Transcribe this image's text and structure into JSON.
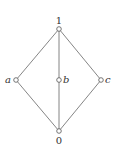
{
  "diagram": {
    "type": "hasse-diagram",
    "nodes": [
      {
        "id": "top",
        "label": "1",
        "x": 59,
        "y": 29,
        "label_pos": "above",
        "italic": false
      },
      {
        "id": "a",
        "label": "a",
        "x": 16,
        "y": 80,
        "label_pos": "left",
        "italic": true
      },
      {
        "id": "b",
        "label": "b",
        "x": 59,
        "y": 80,
        "label_pos": "right",
        "italic": true
      },
      {
        "id": "c",
        "label": "c",
        "x": 101,
        "y": 80,
        "label_pos": "right",
        "italic": true
      },
      {
        "id": "bottom",
        "label": "0",
        "x": 59,
        "y": 131,
        "label_pos": "below",
        "italic": false
      }
    ],
    "edges": [
      [
        "top",
        "a"
      ],
      [
        "top",
        "b"
      ],
      [
        "top",
        "c"
      ],
      [
        "a",
        "bottom"
      ],
      [
        "b",
        "bottom"
      ],
      [
        "c",
        "bottom"
      ]
    ],
    "colors": {
      "line": "#555555",
      "node_fill": "#ffffff",
      "text": "#333333"
    }
  }
}
